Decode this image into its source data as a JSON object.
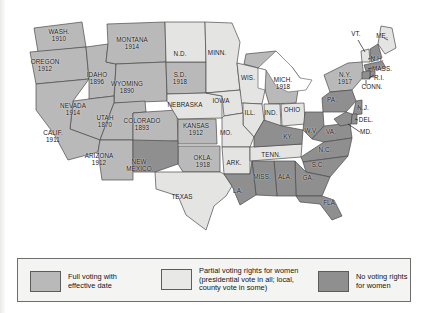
{
  "figure": {
    "kind": "thematic-map",
    "region": "United States"
  },
  "legend": {
    "items": [
      {
        "key": "full",
        "swatch": "full-voting-swatch",
        "color": "#b9b9b9",
        "lines": [
          "Full voting with",
          "effective date"
        ]
      },
      {
        "key": "partial",
        "swatch": "partial-voting-swatch",
        "color": "#e8e8e6",
        "lines": [
          "Partial voting rights for women",
          "(presidential vote in all; local,",
          "county vote in some)"
        ]
      },
      {
        "key": "none",
        "swatch": "no-voting-swatch",
        "color": "#8f8f8f",
        "lines": [
          "No voting rights",
          "for women"
        ]
      }
    ]
  },
  "map_data": {
    "type": "choropleth",
    "categories": [
      "full",
      "partial",
      "none"
    ],
    "states": [
      {
        "abbr": "WASH.",
        "name": "Washington",
        "status": "full",
        "year": "1910",
        "label": "WASH.",
        "x": 59,
        "y": 36
      },
      {
        "abbr": "OREGON",
        "name": "Oregon",
        "status": "full",
        "year": "1912",
        "label": "OREGON",
        "x": 45,
        "y": 66
      },
      {
        "abbr": "IDAHO",
        "name": "Idaho",
        "status": "full",
        "year": "1896",
        "label": "IDAHO",
        "x": 97,
        "y": 79
      },
      {
        "abbr": "MONTANA",
        "name": "Montana",
        "status": "full",
        "year": "1914",
        "label": "MONTANA",
        "x": 132,
        "y": 44
      },
      {
        "abbr": "WYOMING",
        "name": "Wyoming",
        "status": "full",
        "year": "1890",
        "label": "WYOMING",
        "x": 127,
        "y": 88
      },
      {
        "abbr": "NEVADA",
        "name": "Nevada",
        "status": "full",
        "year": "1914",
        "label": "NEVADA",
        "x": 73,
        "y": 110
      },
      {
        "abbr": "UTAH",
        "name": "Utah",
        "status": "full",
        "year": "1870",
        "label": "UTAH",
        "x": 105,
        "y": 122
      },
      {
        "abbr": "COLORADO",
        "name": "Colorado",
        "status": "full",
        "year": "1893",
        "label": "COLORADO",
        "x": 142,
        "y": 125
      },
      {
        "abbr": "CALIF.",
        "name": "California",
        "status": "full",
        "year": "1911",
        "label": "CALIF.",
        "x": 53,
        "y": 137
      },
      {
        "abbr": "ARIZONA",
        "name": "Arizona",
        "status": "full",
        "year": "1912",
        "label": "ARIZONA",
        "x": 99,
        "y": 160
      },
      {
        "abbr": "S.D.",
        "name": "South Dakota",
        "status": "full",
        "year": "1918",
        "label": "S.D.",
        "x": 180,
        "y": 79
      },
      {
        "abbr": "KANSAS",
        "name": "Kansas",
        "status": "full",
        "year": "1912",
        "label": "KANSAS",
        "x": 196,
        "y": 130
      },
      {
        "abbr": "OKLA.",
        "name": "Oklahoma",
        "status": "full",
        "year": "1918",
        "label": "OKLA.",
        "x": 203,
        "y": 162
      },
      {
        "abbr": "MICH.",
        "name": "Michigan",
        "status": "full",
        "year": "1918",
        "label": "MICH.",
        "x": 283,
        "y": 84
      },
      {
        "abbr": "N.Y.",
        "name": "New York",
        "status": "full",
        "year": "1917",
        "label": "N.Y.",
        "x": 345,
        "y": 79
      },
      {
        "abbr": "N.D.",
        "name": "North Dakota",
        "status": "partial",
        "year": "",
        "label": "N.D.",
        "x": 180,
        "y": 54
      },
      {
        "abbr": "MINN.",
        "name": "Minnesota",
        "status": "partial",
        "year": "",
        "label": "MINN.",
        "x": 217,
        "y": 53
      },
      {
        "abbr": "WIS.",
        "name": "Wisconsin",
        "status": "partial",
        "year": "",
        "label": "WIS.",
        "x": 248,
        "y": 78
      },
      {
        "abbr": "NEBRASKA",
        "name": "Nebraska",
        "status": "partial",
        "year": "",
        "label": "NEBRASKA",
        "x": 185,
        "y": 105
      },
      {
        "abbr": "IOWA",
        "name": "Iowa",
        "status": "partial",
        "year": "",
        "label": "IOWA",
        "x": 221,
        "y": 101
      },
      {
        "abbr": "ILL.",
        "name": "Illinois",
        "status": "partial",
        "year": "",
        "label": "ILL.",
        "x": 250,
        "y": 113
      },
      {
        "abbr": "IND.",
        "name": "Indiana",
        "status": "partial",
        "year": "",
        "label": "IND.",
        "x": 271,
        "y": 113
      },
      {
        "abbr": "OHIO",
        "name": "Ohio",
        "status": "partial",
        "year": "",
        "label": "OHIO",
        "x": 292,
        "y": 110
      },
      {
        "abbr": "MO.",
        "name": "Missouri",
        "status": "partial",
        "year": "",
        "label": "MO.",
        "x": 226,
        "y": 133
      },
      {
        "abbr": "ARK.",
        "name": "Arkansas",
        "status": "partial",
        "year": "",
        "label": "ARK.",
        "x": 234,
        "y": 163
      },
      {
        "abbr": "TENN.",
        "name": "Tennessee",
        "status": "partial",
        "year": "",
        "label": "TENN.",
        "x": 271,
        "y": 155
      },
      {
        "abbr": "TEXAS",
        "name": "Texas",
        "status": "partial",
        "year": "",
        "label": "TEXAS",
        "x": 182,
        "y": 197
      },
      {
        "abbr": "VT.",
        "name": "Vermont",
        "status": "partial",
        "year": "",
        "label": "VT.",
        "x": 356,
        "y": 34
      },
      {
        "abbr": "ME.",
        "name": "Maine",
        "status": "partial",
        "year": "",
        "label": "ME.",
        "x": 382,
        "y": 36
      },
      {
        "abbr": "NEW MEXICO",
        "name": "New Mexico",
        "status": "none",
        "year": "",
        "label": "NEW\nMEXICO",
        "x": 139,
        "y": 166
      },
      {
        "abbr": "PA.",
        "name": "Pennsylvania",
        "status": "none",
        "year": "",
        "label": "PA.",
        "x": 332,
        "y": 100
      },
      {
        "abbr": "W.V.",
        "name": "West Virginia",
        "status": "none",
        "year": "",
        "label": "W.V.",
        "x": 311,
        "y": 131
      },
      {
        "abbr": "VA.",
        "name": "Virginia",
        "status": "none",
        "year": "",
        "label": "VA.",
        "x": 331,
        "y": 132
      },
      {
        "abbr": "KY.",
        "name": "Kentucky",
        "status": "none",
        "year": "",
        "label": "KY.",
        "x": 288,
        "y": 137
      },
      {
        "abbr": "N.C.",
        "name": "North Carolina",
        "status": "none",
        "year": "",
        "label": "N.C.",
        "x": 325,
        "y": 150
      },
      {
        "abbr": "S.C.",
        "name": "South Carolina",
        "status": "none",
        "year": "",
        "label": "S.C.",
        "x": 318,
        "y": 165
      },
      {
        "abbr": "GA.",
        "name": "Georgia",
        "status": "none",
        "year": "",
        "label": "GA.",
        "x": 308,
        "y": 178
      },
      {
        "abbr": "ALA.",
        "name": "Alabama",
        "status": "none",
        "year": "",
        "label": "ALA.",
        "x": 285,
        "y": 177
      },
      {
        "abbr": "MISS.",
        "name": "Mississippi",
        "status": "none",
        "year": "",
        "label": "MISS.",
        "x": 262,
        "y": 177
      },
      {
        "abbr": "LA.",
        "name": "Louisiana",
        "status": "none",
        "year": "",
        "label": "LA.",
        "x": 238,
        "y": 191
      },
      {
        "abbr": "FLA.",
        "name": "Florida",
        "status": "none",
        "year": "",
        "label": "FLA.",
        "x": 330,
        "y": 203
      },
      {
        "abbr": "N.H.",
        "name": "New Hampshire",
        "status": "none",
        "year": "",
        "label": "N.H.",
        "x": 377,
        "y": 59
      },
      {
        "abbr": "MASS.",
        "name": "Massachusetts",
        "status": "none",
        "year": "",
        "label": "MASS.",
        "x": 382,
        "y": 69
      },
      {
        "abbr": "R.I.",
        "name": "Rhode Island",
        "status": "none",
        "year": "",
        "label": "R.I.",
        "x": 379,
        "y": 78
      },
      {
        "abbr": "CONN.",
        "name": "Connecticut",
        "status": "none",
        "year": "",
        "label": "CONN.",
        "x": 372,
        "y": 87
      },
      {
        "abbr": "N.J.",
        "name": "New Jersey",
        "status": "none",
        "year": "",
        "label": "N.J.",
        "x": 363,
        "y": 108
      },
      {
        "abbr": "DEL.",
        "name": "Delaware",
        "status": "none",
        "year": "",
        "label": "DEL.",
        "x": 366,
        "y": 120
      },
      {
        "abbr": "MD.",
        "name": "Maryland",
        "status": "none",
        "year": "",
        "label": "MD.",
        "x": 366,
        "y": 132
      }
    ]
  }
}
